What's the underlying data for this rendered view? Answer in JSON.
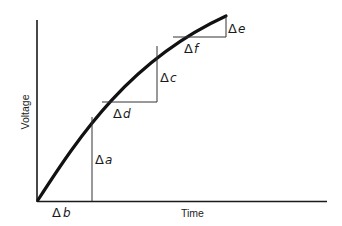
{
  "diagram": {
    "type": "voltage-time-curve",
    "axes": {
      "x_label": "Time",
      "y_label": "Voltage"
    },
    "labels": {
      "a": {
        "delta": "Δ",
        "var": "a"
      },
      "b": {
        "delta": "Δ",
        "var": "b"
      },
      "c": {
        "delta": "Δ",
        "var": "c"
      },
      "d": {
        "delta": "Δ",
        "var": "d"
      },
      "e": {
        "delta": "Δ",
        "var": "e"
      },
      "f": {
        "delta": "Δ",
        "var": "f"
      }
    },
    "colors": {
      "line": "#111111",
      "background": "#ffffff"
    }
  }
}
